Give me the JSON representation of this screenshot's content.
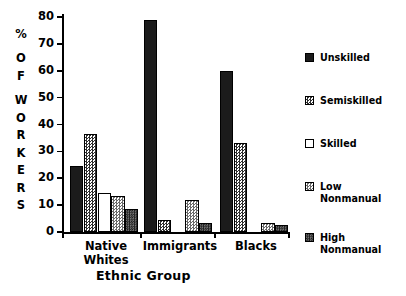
{
  "chart_data": {
    "type": "bar",
    "title": "",
    "xlabel": "Ethnic Group",
    "ylabel": "% OF WORKERS",
    "ylabel_letters": [
      "%",
      "O",
      "F",
      "W",
      "O",
      "R",
      "K",
      "E",
      "R",
      "S"
    ],
    "categories": [
      "Native\nWhites",
      "Immigrants",
      "Blacks"
    ],
    "ylim": [
      0,
      80
    ],
    "yticks": [
      0,
      10,
      20,
      30,
      40,
      50,
      60,
      70,
      80
    ],
    "grid": false,
    "legend_position": "right",
    "series": [
      {
        "name": "Unskilled",
        "pattern": "solid-black",
        "values": [
          24.5,
          79.0,
          60.0
        ]
      },
      {
        "name": "Semiskilled",
        "pattern": "checker-medium",
        "values": [
          36.5,
          4.5,
          33.0
        ]
      },
      {
        "name": "Skilled",
        "pattern": "white-outline",
        "values": [
          14.5,
          0.0,
          0.0
        ]
      },
      {
        "name": "Low\nNonmanual",
        "pattern": "checker-light",
        "values": [
          13.5,
          12.0,
          3.5
        ]
      },
      {
        "name": "High\nNonmanual",
        "pattern": "checker-dark",
        "values": [
          8.5,
          3.5,
          2.5
        ]
      }
    ]
  },
  "colors": {
    "axis": "#000000",
    "solid_black": "#1b1b1b",
    "checker_medium": "#2e2e2e",
    "checker_light": "#6a6a6a",
    "checker_dark": "#2a2a2a",
    "background": "#ffffff"
  },
  "ytick_labels": [
    "0",
    "10",
    "20",
    "30",
    "40",
    "50",
    "60",
    "70",
    "80"
  ],
  "legend": {
    "items": [
      {
        "label": "Unskilled"
      },
      {
        "label": "Semiskilled"
      },
      {
        "label": "Skilled"
      },
      {
        "label": "Low\nNonmanual"
      },
      {
        "label": "High\nNonmanual"
      }
    ]
  }
}
